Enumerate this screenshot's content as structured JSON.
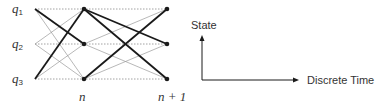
{
  "lattice": {
    "states": [
      {
        "name": "q",
        "sub": "1"
      },
      {
        "name": "q",
        "sub": "2"
      },
      {
        "name": "q",
        "sub": "3"
      }
    ],
    "time_labels": [
      "n",
      "n + 1"
    ],
    "columns_x": [
      35,
      84,
      167
    ],
    "rows_y": [
      9,
      44,
      79
    ],
    "thick_edges": [
      {
        "from": [
          0,
          0
        ],
        "to": [
          1,
          1
        ]
      },
      {
        "from": [
          0,
          2
        ],
        "to": [
          1,
          0
        ]
      },
      {
        "from": [
          1,
          0
        ],
        "to": [
          2,
          1
        ]
      },
      {
        "from": [
          1,
          0
        ],
        "to": [
          2,
          2
        ]
      },
      {
        "from": [
          1,
          2
        ],
        "to": [
          2,
          0
        ]
      }
    ]
  },
  "axes": {
    "y_label": "State",
    "x_label": "Discrete Time"
  },
  "colors": {
    "thick": "#1a1a1a",
    "thin": "#9a9a9a",
    "dotted": "#8a8a8a",
    "text": "#333333"
  }
}
